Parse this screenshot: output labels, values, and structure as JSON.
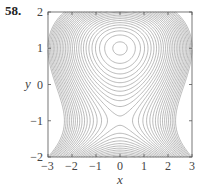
{
  "problem_number": "58.",
  "chart_data": {
    "type": "contour",
    "title": "",
    "xlabel": "x",
    "ylabel": "y",
    "xlim": [
      -3,
      3
    ],
    "ylim": [
      -2,
      2
    ],
    "xticks": [
      -3,
      -2,
      -1,
      0,
      1,
      2,
      3
    ],
    "yticks": [
      -2,
      -1,
      0,
      1,
      2
    ],
    "xtick_labels": [
      "−3",
      "−2",
      "−1",
      "0",
      "1",
      "2",
      "3"
    ],
    "ytick_labels": [
      "−2",
      "−1",
      "0",
      "1",
      "2"
    ],
    "grid": false,
    "features": {
      "local_maximum": [
        0,
        1
      ],
      "saddle_point": [
        0,
        -1
      ]
    },
    "approx_function": "3*y - y^3 - 1.1*x^2",
    "coefficients": {
      "a_y": 3,
      "b_y3": -1,
      "c_x2": -1.1
    },
    "levels": {
      "min": -7.9,
      "max": 1.9,
      "step": 0.35
    },
    "line_color": "#8c8c8c"
  }
}
